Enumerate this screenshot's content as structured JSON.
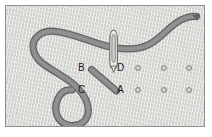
{
  "figure": {
    "frame": {
      "border_color": "#8f8f8f",
      "fabric_color": "#d6d6d2"
    },
    "thread": {
      "color": "#838383",
      "outline_color": "#5e5e5e"
    },
    "needle": {
      "body_color": "#e8e8e4",
      "outline_color": "#6e6e6e"
    },
    "labels": [
      {
        "id": "B",
        "text": "B",
        "x": 77,
        "y": 62
      },
      {
        "id": "D",
        "text": "D",
        "x": 116,
        "y": 62
      },
      {
        "id": "C",
        "text": "C",
        "x": 77,
        "y": 84
      },
      {
        "id": "A",
        "text": "A",
        "x": 116,
        "y": 84
      }
    ],
    "dot_grid": {
      "marker": "open-circle",
      "fill": "#d6d6d2",
      "stroke": "#7a7a7a",
      "radius": 2.4,
      "rows": [
        {
          "y": 67,
          "x": [
            137,
            163,
            188
          ]
        },
        {
          "y": 89,
          "x": [
            137,
            163,
            188
          ]
        }
      ]
    }
  }
}
